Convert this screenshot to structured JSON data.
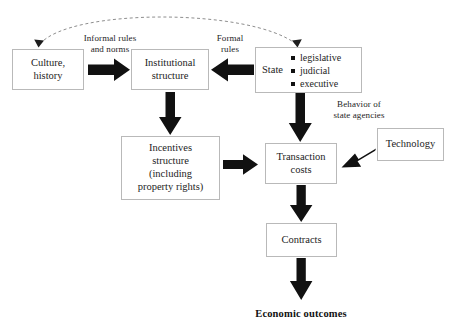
{
  "diagram": {
    "background": "#ffffff",
    "arrow_color": "#111111",
    "box_border_color": "#b9b9b9",
    "text_color": "#1d1d1d"
  },
  "nodes": {
    "culture": {
      "label": "Culture,\nhistory"
    },
    "institutional": {
      "label": "Institutional\nstructure"
    },
    "state": {
      "label": "State",
      "items": [
        "legislative",
        "judicial",
        "executive"
      ]
    },
    "incentives": {
      "label": "Incentives\nstructure\n(including\nproperty rights)"
    },
    "transaction": {
      "label": "Transaction\ncosts"
    },
    "technology": {
      "label": "Technology"
    },
    "contracts": {
      "label": "Contracts"
    }
  },
  "edge_labels": {
    "informal_rules": "Informal rules\nand norms",
    "formal_rules": "Formal\nrules",
    "behavior": "Behavior of\nstate agencies"
  },
  "outcome": {
    "label": "Economic outcomes"
  },
  "edges": [
    {
      "name": "feedback-loop",
      "from": "economic-outcomes",
      "to": "culture-and-state",
      "style": "dashed-curve",
      "double_headed": true
    },
    {
      "name": "culture-to-institutional",
      "from": "culture",
      "to": "institutional",
      "direction": "right",
      "label": "Informal rules and norms"
    },
    {
      "name": "state-to-institutional",
      "from": "state",
      "to": "institutional",
      "direction": "left",
      "label": "Formal rules"
    },
    {
      "name": "institutional-to-incentives",
      "from": "institutional",
      "to": "incentives",
      "direction": "down"
    },
    {
      "name": "state-to-transaction",
      "from": "state",
      "to": "transaction",
      "direction": "down",
      "label": "Behavior of state agencies"
    },
    {
      "name": "incentives-to-transaction",
      "from": "incentives",
      "to": "transaction",
      "direction": "right"
    },
    {
      "name": "technology-to-transaction",
      "from": "technology",
      "to": "transaction",
      "direction": "diagonal-left-down"
    },
    {
      "name": "transaction-to-contracts",
      "from": "transaction",
      "to": "contracts",
      "direction": "down"
    },
    {
      "name": "contracts-to-outcomes",
      "from": "contracts",
      "to": "economic-outcomes",
      "direction": "down"
    }
  ]
}
